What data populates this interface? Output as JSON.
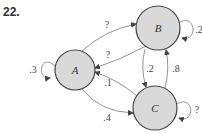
{
  "problem_number": "22.",
  "colors": {
    "node_fill": "#d9d9d9",
    "node_stroke": "#444444",
    "edge": "#666666",
    "text": "#333333"
  },
  "nodes": [
    {
      "id": "A",
      "label": "A",
      "cx": 75,
      "cy": 70,
      "r": 20
    },
    {
      "id": "B",
      "label": "B",
      "cx": 158,
      "cy": 28,
      "r": 22
    },
    {
      "id": "C",
      "label": "C",
      "cx": 155,
      "cy": 108,
      "r": 22
    }
  ],
  "edges": [
    {
      "from": "A",
      "to": "A",
      "label": ".3"
    },
    {
      "from": "A",
      "to": "B",
      "label": "?"
    },
    {
      "from": "B",
      "to": "A",
      "label": "?"
    },
    {
      "from": "C",
      "to": "A",
      "label": ".1"
    },
    {
      "from": "A",
      "to": "C",
      "label": ".4"
    },
    {
      "from": "B",
      "to": "B",
      "label": ".2"
    },
    {
      "from": "B",
      "to": "C",
      "label": ".2"
    },
    {
      "from": "C",
      "to": "B",
      "label": ".8"
    },
    {
      "from": "C",
      "to": "C",
      "label": "?"
    }
  ]
}
